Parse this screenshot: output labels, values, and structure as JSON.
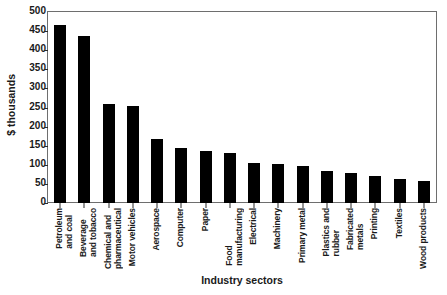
{
  "chart_data": {
    "type": "bar",
    "title": "",
    "xlabel": "Industry sectors",
    "ylabel": "$ thousands",
    "ylim": [
      0,
      500
    ],
    "ytick_step": 50,
    "yticks": [
      500,
      450,
      400,
      350,
      300,
      250,
      200,
      150,
      100,
      50,
      0
    ],
    "grid": false,
    "legend": null,
    "bar_color": "#000000",
    "frame_color": "#6e6e6e",
    "categories": [
      "Petroleum\nand coal",
      "Beverage\nand tobacco",
      "Chemical and\npharmaceutical",
      "Motor vehicles",
      "Aerospace",
      "Computer",
      "Paper",
      "Food\nmanufacturing",
      "Electrical",
      "Machinery",
      "Primary metal",
      "Plastics and\nrubber",
      "Fabricated\nmetals",
      "Printing",
      "Textiles",
      "Wood products"
    ],
    "values": [
      466,
      438,
      258,
      253,
      168,
      143,
      137,
      131,
      104,
      101,
      98,
      83,
      79,
      72,
      63,
      58
    ]
  }
}
